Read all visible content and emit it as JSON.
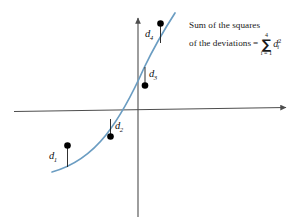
{
  "figure": {
    "type": "least-squares-deviation-diagram",
    "background_color": "#ffffff",
    "axis_color": "#4d4d4d",
    "curve_color": "#6b9dc2",
    "point_color": "#000000",
    "deviation_line_color": "#1a1a1a"
  },
  "annotation": {
    "line1": "Sum of the squares",
    "line2": "of the deviations",
    "equals": "=",
    "sigma": "∑",
    "sigma_upper": "4",
    "sigma_lower": "i = 1",
    "summand_base": "d",
    "summand_sub": "i",
    "summand_sup": "2"
  },
  "axes": {
    "x_axis_label": "",
    "y_axis_label": "",
    "origin": {
      "x": 138,
      "y": 111
    },
    "x_axis": {
      "x1": 14,
      "y1": 111,
      "x2": 292,
      "y2": 107,
      "arrow": "right"
    },
    "y_axis": {
      "x1": 138,
      "y1": 14,
      "x2": 138,
      "y2": 217,
      "arrow": "up"
    }
  },
  "deviations": [
    {
      "id": "d1",
      "label_base": "d",
      "label_sub": "1",
      "point": {
        "x": 67,
        "y": 146
      },
      "curve_anchor": {
        "x": 68,
        "y": 166
      },
      "label_pos": {
        "x": 50,
        "y": 152
      }
    },
    {
      "id": "d2",
      "label_base": "d",
      "label_sub": "2",
      "point": {
        "x": 110,
        "y": 136
      },
      "curve_anchor": {
        "x": 111,
        "y": 120
      },
      "label_pos": {
        "x": 114,
        "y": 122
      }
    },
    {
      "id": "d3",
      "label_base": "d",
      "label_sub": "3",
      "point": {
        "x": 145,
        "y": 85
      },
      "curve_anchor": {
        "x": 144,
        "y": 68
      },
      "label_pos": {
        "x": 149,
        "y": 70
      }
    },
    {
      "id": "d4",
      "label_base": "d",
      "label_sub": "4",
      "point": {
        "x": 160,
        "y": 24
      },
      "curve_anchor": {
        "x": 161,
        "y": 42
      },
      "label_pos": {
        "x": 146,
        "y": 31
      }
    }
  ],
  "curve": {
    "description": "increasing exponential-like regression curve",
    "path": "M 52,172 C 72,166 92,152 108,132 C 122,114 134,92 146,66 C 156,46 164,32 174,14"
  }
}
